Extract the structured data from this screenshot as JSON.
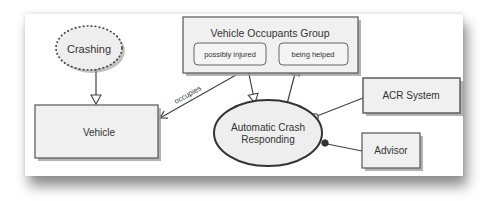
{
  "diagram": {
    "nodes": {
      "crashing": {
        "label": "Crashing",
        "shape": "ellipse",
        "style": "dashed"
      },
      "vehicle": {
        "label": "Vehicle",
        "shape": "rectangle"
      },
      "occupants_group": {
        "label": "Vehicle Occupants Group",
        "shape": "rectangle",
        "states": [
          {
            "label": "possibly injured"
          },
          {
            "label": "being helped"
          }
        ]
      },
      "acr": {
        "label_line1": "Automatic Crash",
        "label_line2": "Responding",
        "shape": "ellipse"
      },
      "acr_system": {
        "label": "ACR System",
        "shape": "rectangle"
      },
      "advisor": {
        "label": "Advisor",
        "shape": "rectangle"
      }
    },
    "edges": [
      {
        "from": "Crashing",
        "to": "Vehicle",
        "type": "bidirectional"
      },
      {
        "from": "Vehicle Occupants Group",
        "to": "Vehicle",
        "label": "occupies"
      },
      {
        "from": "possibly injured",
        "to": "Automatic Crash Responding",
        "type": "arrow"
      },
      {
        "from": "Automatic Crash Responding",
        "to": "being helped",
        "type": "arrow"
      },
      {
        "from": "ACR System",
        "to": "Automatic Crash Responding",
        "type": "instrument"
      },
      {
        "from": "Advisor",
        "to": "Automatic Crash Responding",
        "type": "agent"
      }
    ],
    "edge_labels": {
      "occupies": "occupies"
    },
    "colors": {
      "stroke": "#444444",
      "fill": "#eeeeee",
      "shadow": "#999999",
      "text": "#333333"
    }
  }
}
